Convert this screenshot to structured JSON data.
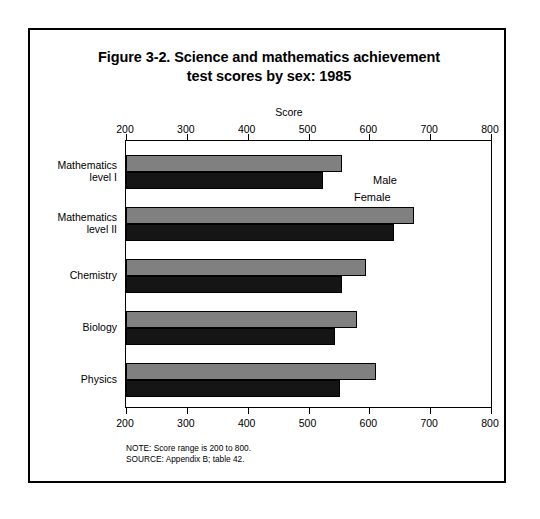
{
  "figure": {
    "title_line1": "Figure 3-2.  Science and mathematics achievement",
    "title_line2": "test scores by sex:  1985",
    "notes": [
      "NOTE:  Score range is 200 to 800.",
      "SOURCE:  Appendix B; table 42."
    ]
  },
  "legend": {
    "male_label": "Male",
    "female_label": "Female",
    "male_color": "#808080",
    "female_color": "#151515"
  },
  "chart_data": {
    "type": "bar",
    "orientation": "horizontal",
    "title": "Figure 3-2.  Science and mathematics achievement test scores by sex:  1985",
    "xlabel": "Score",
    "ylabel": "",
    "xlim": [
      200,
      800
    ],
    "xticks": [
      200,
      300,
      400,
      500,
      600,
      700,
      800
    ],
    "xtick_labels": [
      "200",
      "300",
      "400",
      "500",
      "600",
      "700",
      "800"
    ],
    "grid": false,
    "legend_position": "inline-first-group",
    "categories": [
      "Mathematics level I",
      "Mathematics level II",
      "Chemistry",
      "Biology",
      "Physics"
    ],
    "category_label_lines": [
      [
        "Mathematics",
        "level I"
      ],
      [
        "Mathematics",
        "level II"
      ],
      [
        "Chemistry"
      ],
      [
        "Biology"
      ],
      [
        "Physics"
      ]
    ],
    "series": [
      {
        "name": "Male",
        "color": "#808080",
        "values": [
          555,
          673,
          595,
          580,
          611
        ]
      },
      {
        "name": "Female",
        "color": "#151515",
        "values": [
          524,
          641,
          555,
          544,
          552
        ]
      }
    ],
    "annotations": [
      "NOTE:  Score range is 200 to 800.",
      "SOURCE:  Appendix B; table 42."
    ]
  }
}
